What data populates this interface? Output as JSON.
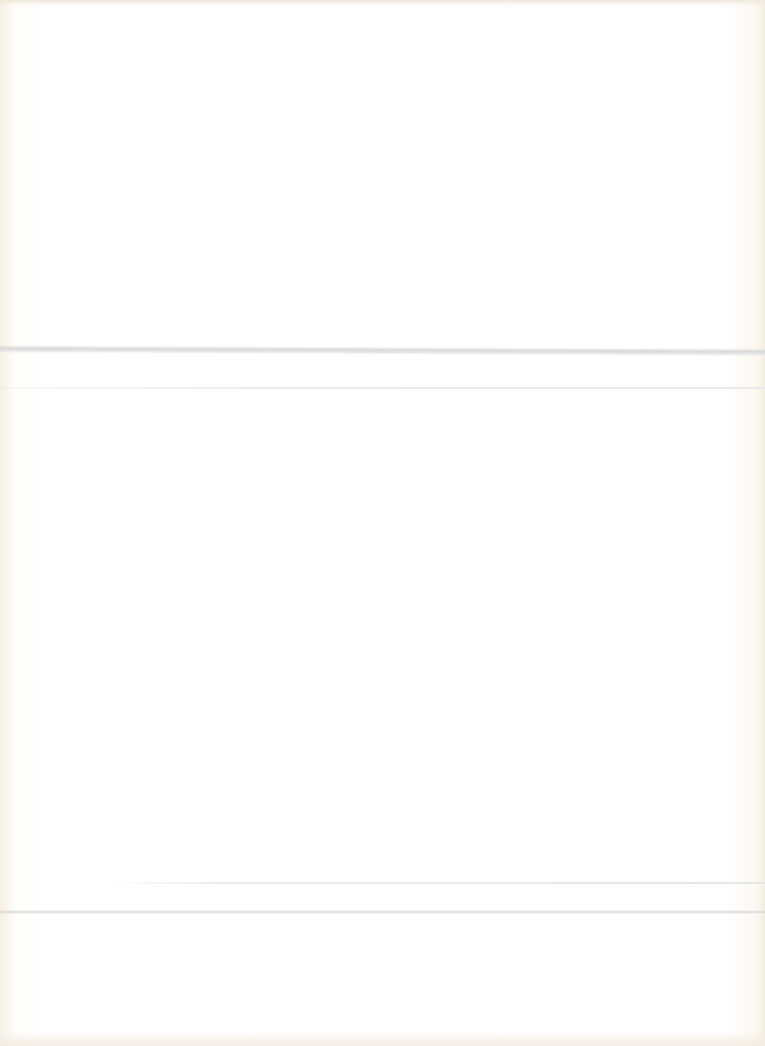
{
  "page": {
    "type": "blank-scanned-sheet",
    "background_color": "#fffefb",
    "text_content": [],
    "creases": [
      {
        "y": 348,
        "color": "#d9d9d9"
      },
      {
        "y": 388,
        "color": "#ececec"
      },
      {
        "y": 883,
        "color": "#e6e6e6"
      },
      {
        "y": 912,
        "color": "#dadada"
      }
    ]
  }
}
